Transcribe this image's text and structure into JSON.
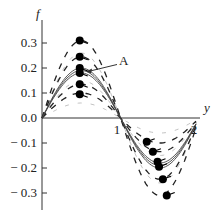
{
  "chart_data": {
    "type": "line",
    "title": "",
    "xlabel": "y",
    "ylabel": "f",
    "xlim": [
      0,
      2.05
    ],
    "ylim": [
      -0.35,
      0.38
    ],
    "grid": false,
    "legend": null,
    "x_ticks": [
      {
        "value": 1,
        "label": "1"
      },
      {
        "value": 2,
        "label": "2"
      }
    ],
    "y_ticks": [
      {
        "value": 0.3,
        "label": "0.3"
      },
      {
        "value": 0.2,
        "label": "0.2"
      },
      {
        "value": 0.1,
        "label": "0.1"
      },
      {
        "value": 0.0,
        "label": "0.0"
      },
      {
        "value": -0.1,
        "label": "− 0.1"
      },
      {
        "value": -0.2,
        "label": "− 0.2"
      },
      {
        "value": -0.3,
        "label": "− 0.3"
      }
    ],
    "annotation": {
      "label": "A",
      "x": 1.0,
      "y": 0.23,
      "arrow_to": {
        "x": 0.52,
        "y": 0.19
      }
    },
    "solid_curves": [
      {
        "name": "curve-1",
        "amplitude": 0.18
      },
      {
        "name": "curve-2",
        "amplitude": 0.19
      },
      {
        "name": "curve-3",
        "amplitude": 0.2
      }
    ],
    "dashed_curves": [
      {
        "name": "dashed-1",
        "amplitude": 0.1
      },
      {
        "name": "dashed-2",
        "amplitude": 0.135
      },
      {
        "name": "dashed-3",
        "amplitude": 0.245
      },
      {
        "name": "dashed-4",
        "amplitude": 0.31
      }
    ],
    "peak_points": [
      {
        "x": 0.49,
        "y": 0.31
      },
      {
        "x": 0.49,
        "y": 0.245
      },
      {
        "x": 0.49,
        "y": 0.2
      },
      {
        "x": 0.49,
        "y": 0.18
      },
      {
        "x": 0.49,
        "y": 0.135
      },
      {
        "x": 0.49,
        "y": 0.095
      }
    ],
    "trough_points": [
      {
        "x": 1.36,
        "y": -0.095
      },
      {
        "x": 1.44,
        "y": -0.135
      },
      {
        "x": 1.5,
        "y": -0.175
      },
      {
        "x": 1.52,
        "y": -0.195
      },
      {
        "x": 1.57,
        "y": -0.245
      },
      {
        "x": 1.62,
        "y": -0.31
      }
    ]
  }
}
